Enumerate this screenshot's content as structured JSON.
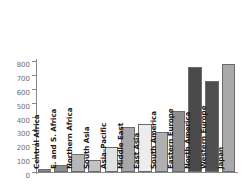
{
  "chart_data": {
    "type": "bar",
    "title": "",
    "xlabel": "",
    "ylabel": "",
    "ylim": [
      0,
      800
    ],
    "ytick_values": [
      800,
      700,
      600,
      500,
      400,
      300,
      200,
      100,
      0
    ],
    "ytick_labels": [
      "800",
      "700",
      "600",
      "500",
      "400",
      "300",
      "200",
      "100",
      "0"
    ],
    "grid": false,
    "legend": "none",
    "categories": [
      "Central Africa",
      "E. and S. Africa",
      "Northern Africa",
      "South Asia",
      "Asia–Pacific",
      "Middle East",
      "East Asia",
      "South America",
      "Eastern Europe",
      "North America",
      "Western Europe",
      "Japan"
    ],
    "values": [
      20,
      48,
      130,
      85,
      182,
      325,
      345,
      287,
      440,
      755,
      655,
      775
    ],
    "bar_colors": [
      "#8c8c8c",
      "#8c8c8c",
      "#b6b6b6",
      "#c3c3c3",
      "#e2e2e2",
      "#a8a8a8",
      "#ededed",
      "#b0b0b0",
      "#8f8f8f",
      "#4a4a4a",
      "#4f4f4f",
      "#a9a9a9"
    ],
    "axis_color": "#8a8a8a",
    "label_color": "#1a1a1a",
    "tick_label_color": "#6e6e6e",
    "background_color": "#ffffff"
  }
}
